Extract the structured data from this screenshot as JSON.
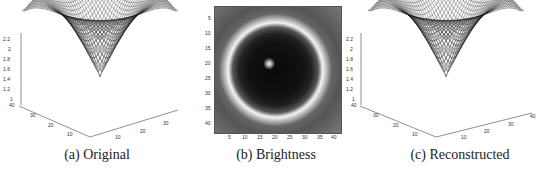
{
  "figure": {
    "panels": [
      {
        "id": "a",
        "caption": "(a) Original",
        "type": "3d-mesh-surface",
        "z_ticks": [
          "2.2",
          "2",
          "1.8",
          "1.6",
          "1.4",
          "1.2",
          "1"
        ],
        "y_ticks": [
          "40",
          "30",
          "20",
          "10"
        ],
        "x_ticks": [
          "10",
          "20",
          "30"
        ]
      },
      {
        "id": "b",
        "caption": "(b) Brightness",
        "type": "grayscale-image",
        "y_ticks": [
          "5",
          "10",
          "15",
          "20",
          "25",
          "30",
          "35",
          "40"
        ],
        "x_ticks": [
          "5",
          "10",
          "15",
          "20",
          "25",
          "30",
          "35",
          "40"
        ]
      },
      {
        "id": "c",
        "caption": "(c) Reconstructed",
        "type": "3d-mesh-surface",
        "z_ticks": [
          "2.2",
          "2",
          "1.8",
          "1.6",
          "1.4",
          "1.2",
          "1"
        ],
        "y_ticks": [
          "40",
          "30",
          "20",
          "10"
        ],
        "x_ticks": [
          "10",
          "20",
          "30",
          "40"
        ]
      }
    ]
  },
  "chart_data": [
    {
      "type": "surface",
      "title": "(a) Original",
      "zlim": [
        1,
        2.2
      ],
      "x_range": [
        0,
        40
      ],
      "y_range": [
        0,
        40
      ],
      "description": "Radially symmetric bowl surface: central dip to ~1.0, rising to ~2.2 at mid-radius ridge, descending toward corners (~1.8)"
    },
    {
      "type": "heatmap",
      "title": "(b) Brightness",
      "x_range": [
        1,
        42
      ],
      "y_range": [
        1,
        42
      ],
      "description": "Dark disc with bright center spot at ~(19,20) and bright ring of radius ~18 px units; gray corners"
    },
    {
      "type": "surface",
      "title": "(c) Reconstructed",
      "zlim": [
        1,
        2.2
      ],
      "x_range": [
        0,
        40
      ],
      "y_range": [
        0,
        40
      ],
      "description": "Reconstructed surface closely matching original bowl shape"
    }
  ]
}
